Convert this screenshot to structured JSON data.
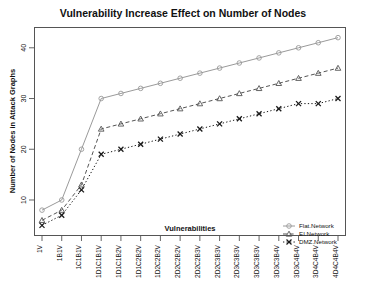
{
  "chart_data": {
    "type": "line",
    "title": "Vulnerability Increase Effect on Number of Nodes",
    "xlabel": "Vulnerabilities",
    "ylabel": "Number of Nodes in Attack Graphs",
    "categories": [
      "1V",
      "1B1V",
      "1C1B1V",
      "1D1C1B1V",
      "1D1C1B2V",
      "1D1C2B2V",
      "1D2C2B2V",
      "2D2C2B2V",
      "2D2C2B3V",
      "2D2C3B3V",
      "2D3C3B3V",
      "3D3C3B3V",
      "3D3C3B4V",
      "3D3C4B4V",
      "3D4C4B4V",
      "4D4C4B4V"
    ],
    "series": [
      {
        "name": "Flat.Network",
        "marker": "circle",
        "linestyle": "solid",
        "color": "#9a9a9a",
        "values": [
          8,
          10,
          20,
          30,
          31,
          32,
          33,
          34,
          35,
          36,
          37,
          38,
          39,
          40,
          41,
          42
        ]
      },
      {
        "name": "EI.Network",
        "marker": "triangle",
        "linestyle": "dashed",
        "color": "#555555",
        "values": [
          6,
          8,
          13,
          24,
          25,
          26,
          27,
          28,
          29,
          30,
          31,
          32,
          33,
          34,
          35,
          36
        ]
      },
      {
        "name": "DMZ.Network",
        "marker": "cross",
        "linestyle": "dotted",
        "color": "#1a1a1a",
        "values": [
          5,
          7,
          12,
          19,
          20,
          21,
          22,
          23,
          24,
          25,
          26,
          27,
          28,
          29,
          29,
          30
        ]
      }
    ],
    "yticks": [
      10,
      20,
      30,
      40
    ],
    "ylim": [
      3,
      44
    ],
    "grid": false,
    "legend_position": "bottom-right"
  },
  "legend": {
    "entries": [
      {
        "label": "Flat.Network"
      },
      {
        "label": "EI.Network"
      },
      {
        "label": "DMZ.Network"
      }
    ]
  }
}
